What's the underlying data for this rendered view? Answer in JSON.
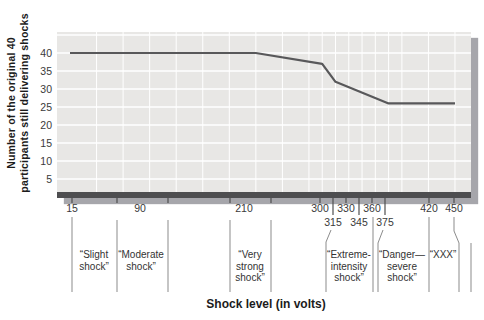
{
  "figure": {
    "x_axis_title": "Shock level (in volts)"
  },
  "chart_data": {
    "type": "line",
    "title": "",
    "xlabel": "Shock level (in volts)",
    "ylabel": "Number of the original 40 participants still delivering shocks",
    "ylabel_lines": [
      "Number of the original 40",
      "participants still delivering shocks"
    ],
    "x_ticks": [
      15,
      90,
      210,
      300,
      315,
      330,
      345,
      360,
      375,
      420,
      450
    ],
    "y_ticks": [
      5,
      10,
      15,
      20,
      25,
      30,
      35,
      40
    ],
    "xlim": [
      15,
      450
    ],
    "ylim": [
      0,
      45
    ],
    "grid": true,
    "series": [
      {
        "name": "participants still delivering shocks",
        "points": [
          [
            15,
            40
          ],
          [
            225,
            40
          ],
          [
            300,
            37
          ],
          [
            315,
            32
          ],
          [
            375,
            26
          ],
          [
            450,
            26
          ]
        ]
      }
    ],
    "shock_categories": [
      {
        "lines": [
          "“Slight",
          "shock”"
        ]
      },
      {
        "lines": [
          "“Moderate",
          "shock”"
        ]
      },
      {
        "lines": [
          "“Very",
          "strong",
          "shock”"
        ]
      },
      {
        "lines": [
          "“Extreme-",
          "intensity",
          "shock”"
        ]
      },
      {
        "lines": [
          "“Danger—",
          "severe",
          "shock”"
        ]
      },
      {
        "lines": [
          "“XXX”"
        ]
      }
    ],
    "colors": {
      "line": "#58585a",
      "plot_background": "#e8e7e5",
      "axis_bar": "#4e4e50",
      "shadow": "#a6a6ab",
      "gridline": "#ffffff",
      "tick": "#4f4f4f",
      "divider": "#8b8b8b",
      "text": "#2f2f2f"
    }
  }
}
